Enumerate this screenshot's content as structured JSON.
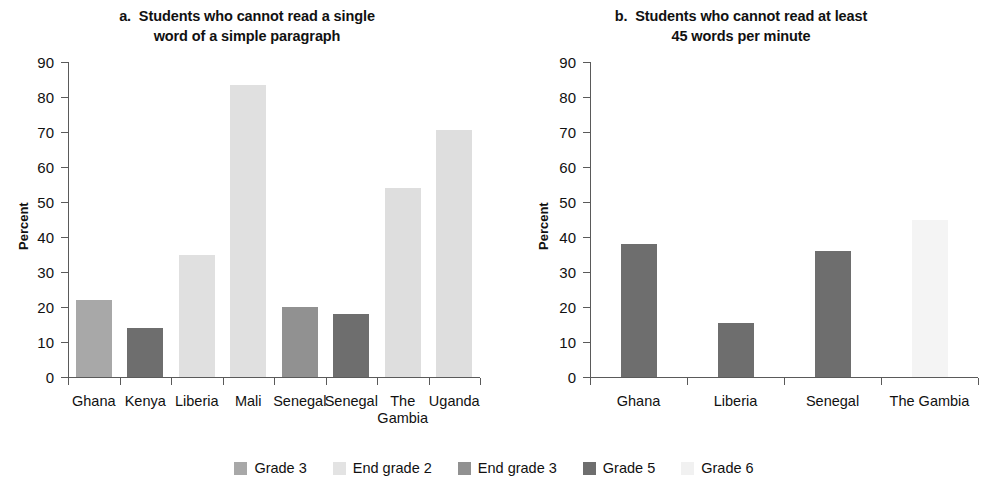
{
  "figure": {
    "ylabel": "Percent",
    "y_ticks": [
      "90",
      "80",
      "70",
      "60",
      "50",
      "40",
      "30",
      "20",
      "10",
      "0"
    ]
  },
  "legend": {
    "items": [
      {
        "label": "Grade 3",
        "color": "#a8a8a8"
      },
      {
        "label": "End grade 2",
        "color": "#e3e3e3"
      },
      {
        "label": "End grade 3",
        "color": "#919191"
      },
      {
        "label": "Grade 5",
        "color": "#6e6e6e"
      },
      {
        "label": "Grade 6",
        "color": "#f1f1f1"
      }
    ]
  },
  "panel_a": {
    "title_line1": "a.  Students who cannot read a single",
    "title_line2": "word of a simple paragraph"
  },
  "panel_b": {
    "title_line1": "b.  Students who cannot read at least",
    "title_line2": "45 words per minute"
  },
  "chart_data": [
    {
      "type": "bar",
      "panel": "a",
      "title": "a. Students who cannot read a single word of a simple paragraph",
      "xlabel": "",
      "ylabel": "Percent",
      "ylim": [
        0,
        90
      ],
      "yticks": [
        0,
        10,
        20,
        30,
        40,
        50,
        60,
        70,
        80,
        90
      ],
      "grid": false,
      "legend_position": "bottom",
      "categories": [
        "Ghana",
        "Kenya",
        "Liberia",
        "Mali",
        "Senegal",
        "Senegal",
        "The Gambia",
        "Uganda"
      ],
      "category_labels": [
        "Ghana",
        "Kenya",
        "Liberia",
        "Mali",
        "Senegal",
        "Senegal",
        "The\nGambia",
        "Uganda"
      ],
      "values": [
        22,
        14,
        35,
        83.5,
        20,
        18,
        54,
        70.5
      ],
      "series_per_bar": [
        "Grade 3",
        "Grade 5",
        "End grade 2",
        "End grade 2",
        "End grade 3",
        "Grade 5",
        "End grade 2",
        "End grade 2"
      ],
      "bar_colors": [
        "#a8a8a8",
        "#6e6e6e",
        "#e0e0e0",
        "#e0e0e0",
        "#919191",
        "#6e6e6e",
        "#dedede",
        "#dedede"
      ]
    },
    {
      "type": "bar",
      "panel": "b",
      "title": "b. Students who cannot read at least 45 words per minute",
      "xlabel": "",
      "ylabel": "Percent",
      "ylim": [
        0,
        90
      ],
      "yticks": [
        0,
        10,
        20,
        30,
        40,
        50,
        60,
        70,
        80,
        90
      ],
      "grid": false,
      "legend_position": "bottom",
      "categories": [
        "Ghana",
        "Liberia",
        "Senegal",
        "The Gambia"
      ],
      "category_labels": [
        "Ghana",
        "Liberia",
        "Senegal",
        "The Gambia"
      ],
      "values": [
        38,
        15.3,
        36,
        45
      ],
      "series_per_bar": [
        "Grade 5",
        "Grade 5",
        "Grade 5",
        "Grade 6"
      ],
      "bar_colors": [
        "#6e6e6e",
        "#6e6e6e",
        "#6e6e6e",
        "#f4f4f4"
      ]
    }
  ]
}
